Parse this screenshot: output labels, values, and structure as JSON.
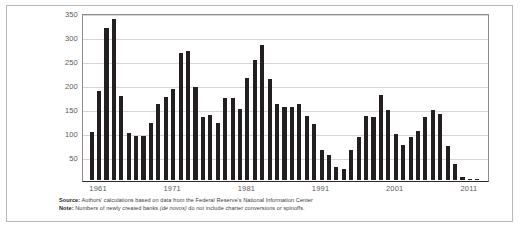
{
  "figure": {
    "background_color": "#ffffff",
    "border_color": "#b9b9b9",
    "bar_color": "#231f20",
    "grid_color": "#d6d6d6",
    "axis_text_color": "#59595b"
  },
  "footnotes": {
    "source_lead": "Source:",
    "source_text": " Authors' calculations based on data from the Federal Reserve's National Information Center",
    "note_lead": "Note:",
    "note_text_before": " Numbers of newly created banks ",
    "note_italic": "(de novos)",
    "note_text_after": " do not include charter conversions or spinoffs."
  },
  "chart_data": {
    "type": "bar",
    "title": "",
    "subtitle": "",
    "xlabel": "",
    "ylabel": "",
    "ylim": [
      0,
      350
    ],
    "yticks": [
      50,
      100,
      150,
      200,
      250,
      300,
      350
    ],
    "xticks": [
      1961,
      1971,
      1981,
      1991,
      2001,
      2011
    ],
    "grid": true,
    "legend": "none",
    "categories": [
      1960,
      1961,
      1962,
      1963,
      1964,
      1965,
      1966,
      1967,
      1968,
      1969,
      1970,
      1971,
      1972,
      1973,
      1974,
      1975,
      1976,
      1977,
      1978,
      1979,
      1980,
      1981,
      1982,
      1983,
      1984,
      1985,
      1986,
      1987,
      1988,
      1989,
      1990,
      1991,
      1992,
      1993,
      1994,
      1995,
      1996,
      1997,
      1998,
      1999,
      2000,
      2001,
      2002,
      2003,
      2004,
      2005,
      2006,
      2007,
      2008,
      2009,
      2010,
      2011,
      2012
    ],
    "values": [
      102,
      187,
      320,
      340,
      178,
      99,
      92,
      92,
      120,
      161,
      174,
      192,
      268,
      273,
      196,
      132,
      138,
      120,
      173,
      172,
      149,
      215,
      252,
      285,
      214,
      161,
      155,
      153,
      160,
      134,
      118,
      63,
      52,
      27,
      23,
      64,
      91,
      136,
      132,
      179,
      148,
      98,
      73,
      90,
      103,
      132,
      147,
      140,
      71,
      34,
      6,
      3,
      2
    ]
  }
}
